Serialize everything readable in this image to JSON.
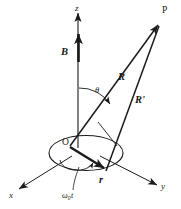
{
  "figure": {
    "kind": "vector-diagram",
    "background_color": "#ffffff",
    "line_color": "#1a1a1a"
  },
  "axes": {
    "z": {
      "label": "z",
      "direction": "up"
    },
    "x": {
      "label": "x",
      "direction": "down-left"
    },
    "y": {
      "label": "y",
      "direction": "down-right"
    }
  },
  "points": {
    "origin": {
      "label": "O"
    },
    "field_point": {
      "label": "P"
    }
  },
  "vectors": {
    "magnetic_field": {
      "label": "B",
      "bold": true
    },
    "position_R": {
      "label": "R",
      "bold": true
    },
    "position_R_prime": {
      "label": "R'",
      "bold": true
    },
    "radius_r": {
      "label": "r",
      "bold": true
    }
  },
  "angles": {
    "theta": {
      "label": "θ"
    },
    "phase": {
      "omega": "ω",
      "subscript": "0",
      "variable": "t"
    }
  }
}
